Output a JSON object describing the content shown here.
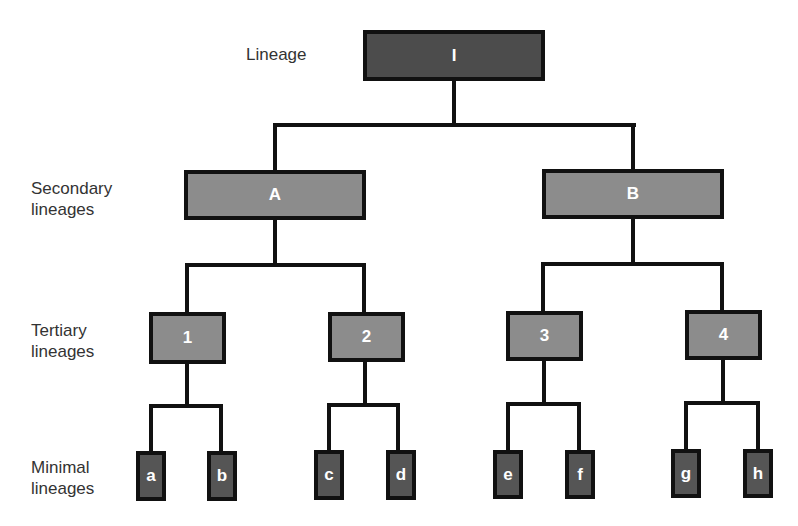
{
  "diagram": {
    "type": "hierarchy",
    "levels": [
      {
        "label": "Lineage"
      },
      {
        "label": "Secondary\nlineages"
      },
      {
        "label": "Tertiary\nlineages"
      },
      {
        "label": "Minimal\nlineages"
      }
    ],
    "nodes": {
      "root": {
        "label": "I"
      },
      "secondary": [
        {
          "label": "A"
        },
        {
          "label": "B"
        }
      ],
      "tertiary": [
        {
          "label": "1"
        },
        {
          "label": "2"
        },
        {
          "label": "3"
        },
        {
          "label": "4"
        }
      ],
      "minimal": [
        {
          "label": "a"
        },
        {
          "label": "b"
        },
        {
          "label": "c"
        },
        {
          "label": "d"
        },
        {
          "label": "e"
        },
        {
          "label": "f"
        },
        {
          "label": "g"
        },
        {
          "label": "h"
        }
      ]
    },
    "colors": {
      "root": "#4c4c4c",
      "secondary": "#8c8c8c",
      "tertiary": "#8c8c8c",
      "minimal": "#555555",
      "stroke": "#111111",
      "text": "#ffffff"
    }
  }
}
